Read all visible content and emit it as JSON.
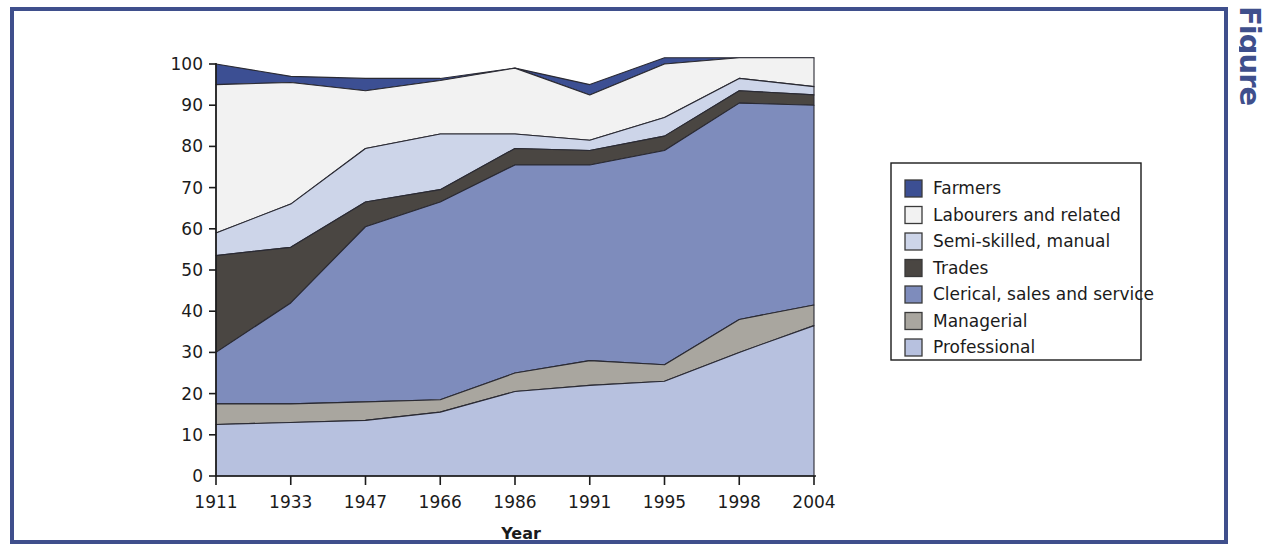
{
  "frame": {
    "border_color": "#3f4f8c",
    "edge_text": "Figure"
  },
  "chart_data": {
    "type": "area",
    "stacked": true,
    "title": "",
    "xlabel": "Year",
    "ylabel": "",
    "categories": [
      "1911",
      "1933",
      "1947",
      "1966",
      "1986",
      "1991",
      "1995",
      "1998",
      "2004"
    ],
    "x": [
      1911,
      1933,
      1947,
      1966,
      1986,
      1991,
      1995,
      1998,
      2004
    ],
    "ylim": [
      0,
      100
    ],
    "y_ticks": [
      0,
      10,
      20,
      30,
      40,
      50,
      60,
      70,
      80,
      90,
      100
    ],
    "grid": false,
    "legend_position": "right",
    "series": [
      {
        "name": "Farmers",
        "color": "#3c4f93",
        "values": [
          5.0,
          1.5,
          3.0,
          0.5,
          0.0,
          2.5,
          1.5,
          0.0,
          0.0
        ],
        "cumulative_top": [
          100.0,
          97.0,
          96.5,
          96.5,
          99.0,
          95.0,
          101.5,
          101.5,
          101.5
        ]
      },
      {
        "name": "Labourers and related",
        "color": "#f2f2f2",
        "values": [
          36.0,
          29.5,
          14.0,
          13.0,
          16.0,
          11.0,
          13.0,
          5.0,
          7.0
        ],
        "cumulative_top": [
          95.0,
          95.5,
          93.5,
          96.0,
          99.0,
          92.5,
          100.0,
          101.5,
          101.5
        ]
      },
      {
        "name": "Semi-skilled, manual",
        "color": "#cdd5e9",
        "values": [
          5.5,
          10.5,
          13.0,
          13.5,
          3.5,
          2.5,
          4.5,
          0.5,
          2.0
        ],
        "cumulative_top": [
          59.0,
          66.0,
          79.5,
          83.0,
          83.0,
          81.5,
          87.0,
          96.5,
          94.5
        ]
      },
      {
        "name": "Trades",
        "color": "#4a4642",
        "values": [
          23.5,
          13.5,
          6.0,
          3.0,
          4.0,
          3.5,
          3.5,
          3.0,
          2.5
        ],
        "cumulative_top": [
          53.5,
          55.5,
          66.5,
          69.5,
          79.5,
          79.0,
          82.5,
          93.5,
          92.5
        ]
      },
      {
        "name": "Clerical, sales and service",
        "color": "#7e8cbc",
        "values": [
          12.5,
          24.5,
          42.5,
          48.0,
          50.5,
          47.5,
          52.0,
          52.5,
          48.5
        ],
        "cumulative_top": [
          30.0,
          42.0,
          60.5,
          66.5,
          75.5,
          75.5,
          79.0,
          90.5,
          90.0
        ]
      },
      {
        "name": "Managerial",
        "color": "#a9a69f",
        "values": [
          5.0,
          4.5,
          4.5,
          3.0,
          4.5,
          6.0,
          4.0,
          8.0,
          5.0
        ],
        "cumulative_top": [
          17.5,
          17.5,
          18.0,
          18.5,
          25.0,
          28.0,
          27.0,
          38.0,
          41.5
        ]
      },
      {
        "name": "Professional",
        "color": "#b7c1df",
        "values": [
          12.5,
          13.0,
          13.5,
          15.5,
          20.5,
          22.0,
          23.0,
          30.0,
          36.5
        ],
        "cumulative_top": [
          12.5,
          13.0,
          13.5,
          15.5,
          20.5,
          22.0,
          23.0,
          30.0,
          36.5
        ]
      }
    ]
  },
  "legend": {
    "items": [
      {
        "label": "Farmers",
        "color": "#3c4f93"
      },
      {
        "label": "Labourers and related",
        "color": "#f2f2f2"
      },
      {
        "label": "Semi-skilled, manual",
        "color": "#cdd5e9"
      },
      {
        "label": "Trades",
        "color": "#4a4642"
      },
      {
        "label": "Clerical, sales and service",
        "color": "#7e8cbc"
      },
      {
        "label": "Managerial",
        "color": "#a9a69f"
      },
      {
        "label": "Professional",
        "color": "#b7c1df"
      }
    ]
  }
}
